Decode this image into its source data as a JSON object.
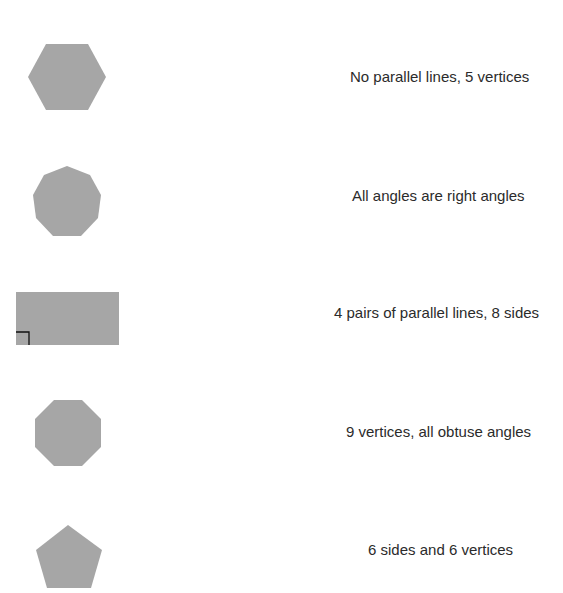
{
  "exercise": {
    "shapes": [
      {
        "name": "hexagon",
        "sides": 6,
        "fill": "#a6a6a6"
      },
      {
        "name": "nonagon",
        "sides": 9,
        "fill": "#a6a6a6"
      },
      {
        "name": "rectangle",
        "sides": 4,
        "fill": "#a6a6a6",
        "right_angle_marker": true
      },
      {
        "name": "octagon",
        "sides": 8,
        "fill": "#a6a6a6"
      },
      {
        "name": "pentagon",
        "sides": 5,
        "fill": "#a6a6a6"
      }
    ],
    "descriptions": [
      {
        "text": "No parallel lines, 5 vertices"
      },
      {
        "text": "All angles are right angles"
      },
      {
        "text": "4 pairs of parallel lines, 8 sides"
      },
      {
        "text": "9 vertices, all obtuse angles"
      },
      {
        "text": "6 sides and 6 vertices"
      }
    ]
  },
  "colors": {
    "shape_fill": "#a6a6a6",
    "text": "#2b2b2b",
    "marker": "#111111"
  }
}
